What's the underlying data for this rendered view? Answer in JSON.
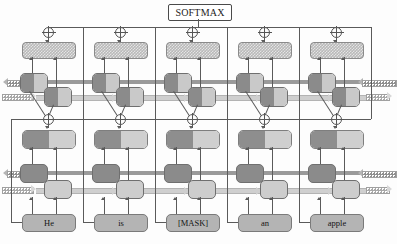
{
  "diagram": {
    "title_node": {
      "label": "SOFTMAX",
      "name": "softmax-node"
    },
    "type": "bidirectional-rnn-language-model",
    "timesteps": 5,
    "layers": 2,
    "tokens": [
      {
        "index": 0,
        "label": "He"
      },
      {
        "index": 1,
        "label": "is"
      },
      {
        "index": 2,
        "label": "[MASK]"
      },
      {
        "index": 3,
        "label": "an"
      },
      {
        "index": 4,
        "label": "apple"
      }
    ],
    "operators": {
      "concat_symbol": "plus-circle",
      "top_row_count": 5,
      "middle_row_count": 5
    },
    "colors": {
      "dark_cell": "#8b8b8b",
      "light_cell": "#cdcdcd",
      "hatched_output": "#b9b9b9",
      "word_box": "#b4b4b4",
      "wire": "#5a5a5a",
      "backward_arrow": "#9a9a9a",
      "forward_arrow": "#cfcfcf",
      "softmax_border": "#4a4a4a"
    },
    "directions": {
      "backward": "right-to-left",
      "forward": "left-to-right"
    }
  }
}
